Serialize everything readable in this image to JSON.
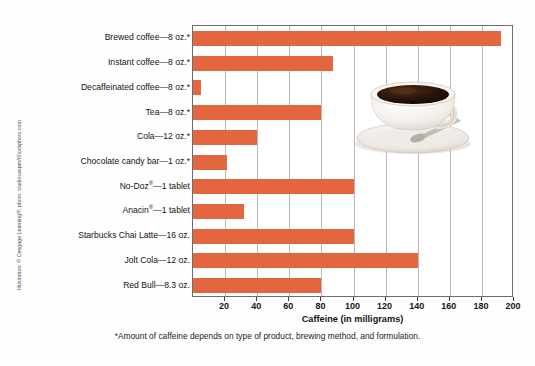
{
  "figure": {
    "credit": "Illustration: © Cengage Learning®; photo: studiocasper/iStockphoto.com",
    "footnote": "*Amount of caffeine depends on type of product, brewing method, and formulation.",
    "photo_alt": "coffee-cup-photo",
    "bar_color": "#e4663f",
    "grid_color": "#b9b9b9",
    "frame_color": "#6d6d6d"
  },
  "chart_data": {
    "type": "bar",
    "orientation": "horizontal",
    "title": "",
    "xlabel": "Caffeine (in milligrams)",
    "ylabel": "",
    "xlim": [
      0,
      200
    ],
    "xticks": [
      20,
      40,
      60,
      80,
      100,
      120,
      140,
      160,
      180,
      200
    ],
    "grid": true,
    "legend": "none",
    "categories": [
      "Brewed coffee—8 oz.*",
      "Instant coffee—8 oz.*",
      "Decaffeinated coffee—8 oz.*",
      "Tea—8 oz.*",
      "Cola—12 oz.*",
      "Chocolate candy bar—1 oz.*",
      "No-Doz®—1 tablet",
      "Anacin®—1 tablet",
      "Starbucks Chai Latte—16 oz.",
      "Jolt Cola—12 oz.",
      "Red Bull—8.3 oz."
    ],
    "values": [
      192,
      87,
      5,
      80,
      40,
      21,
      100,
      32,
      100,
      140,
      80
    ]
  }
}
